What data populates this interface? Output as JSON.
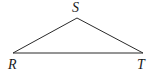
{
  "diagram": {
    "type": "triangle",
    "stroke_color": "#2a2a2a",
    "vertices": [
      {
        "id": "S",
        "label": "S",
        "x": 77,
        "y": 18
      },
      {
        "id": "R",
        "label": "R",
        "x": 13,
        "y": 53
      },
      {
        "id": "T",
        "label": "T",
        "x": 143,
        "y": 53
      }
    ],
    "labels": {
      "S": "S",
      "R": "R",
      "T": "T"
    }
  }
}
